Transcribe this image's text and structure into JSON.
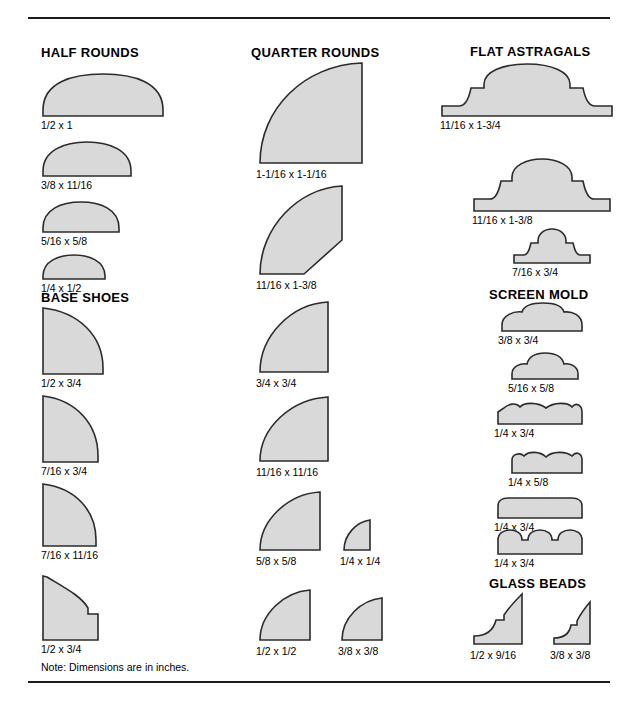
{
  "document": {
    "note": "Note: Dimensions are in inches.",
    "fill_color": "#d9d9d9",
    "stroke_color": "#2b2b2b",
    "background_color": "#ffffff"
  },
  "sections": [
    {
      "id": "half-rounds",
      "title": "HALF ROUNDS",
      "items": [
        {
          "label": "1/2 x 1"
        },
        {
          "label": "3/8 x 11/16"
        },
        {
          "label": "5/16 x 5/8"
        },
        {
          "label": "1/4 x 1/2"
        }
      ]
    },
    {
      "id": "base-shoes",
      "title": "BASE SHOES",
      "items": [
        {
          "label": "1/2 x 3/4"
        },
        {
          "label": "7/16 x 3/4"
        },
        {
          "label": "7/16 x 11/16"
        },
        {
          "label": "1/2 x 3/4"
        }
      ]
    },
    {
      "id": "quarter-rounds",
      "title": "QUARTER ROUNDS",
      "items": [
        {
          "label": "1-1/16 x 1-1/16"
        },
        {
          "label": "11/16 x 1-3/8"
        },
        {
          "label": "3/4 x 3/4"
        },
        {
          "label": "11/16 x 11/16"
        },
        {
          "label": "5/8 x 5/8"
        },
        {
          "label": "1/4 x 1/4"
        },
        {
          "label": "1/2 x 1/2"
        },
        {
          "label": "3/8 x 3/8"
        }
      ]
    },
    {
      "id": "flat-astragals",
      "title": "FLAT ASTRAGALS",
      "items": [
        {
          "label": "11/16 x 1-3/4"
        },
        {
          "label": "11/16 x 1-3/8"
        },
        {
          "label": "7/16 x 3/4"
        }
      ]
    },
    {
      "id": "screen-mold",
      "title": "SCREEN MOLD",
      "items": [
        {
          "label": "3/8 x 3/4"
        },
        {
          "label": "5/16 x 5/8"
        },
        {
          "label": "1/4 x 3/4"
        },
        {
          "label": "1/4 x 5/8"
        },
        {
          "label": "1/4 x 3/4"
        },
        {
          "label": "1/4 x 3/4"
        }
      ]
    },
    {
      "id": "glass-beads",
      "title": "GLASS BEADS",
      "items": [
        {
          "label": "1/2 x 9/16"
        },
        {
          "label": "3/8 x 3/8"
        }
      ]
    }
  ]
}
